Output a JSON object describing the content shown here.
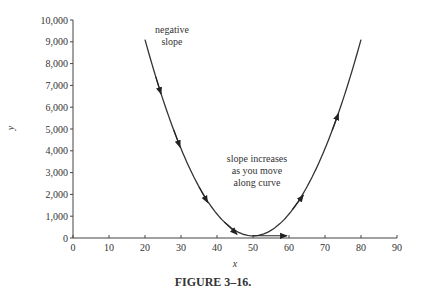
{
  "chart_data": {
    "type": "line",
    "title": "",
    "caption": "FIGURE 3–16.",
    "xlabel": "x",
    "ylabel": "y",
    "xlim": [
      0,
      90
    ],
    "ylim": [
      0,
      10000
    ],
    "x_ticks": [
      "0",
      "10",
      "20",
      "30",
      "40",
      "50",
      "60",
      "70",
      "80",
      "90"
    ],
    "y_ticks": [
      "0",
      "1,000",
      "2,000",
      "3,000",
      "4,000",
      "5,000",
      "6,000",
      "7,000",
      "8,000",
      "9,000",
      "10,000"
    ],
    "grid": false,
    "legend": null,
    "series": [
      {
        "name": "curve",
        "x": [
          20,
          25,
          30,
          35,
          40,
          45,
          50,
          55,
          60,
          65,
          70,
          75,
          80
        ],
        "y": [
          9100,
          6350,
          4100,
          2350,
          1100,
          350,
          100,
          350,
          1100,
          2350,
          4100,
          6350,
          9100
        ]
      }
    ],
    "tangent_arrows": [
      {
        "x": 23,
        "y": 7400,
        "direction": "down"
      },
      {
        "x": 28,
        "y": 4950,
        "direction": "down"
      },
      {
        "x": 35,
        "y": 2350,
        "direction": "down"
      },
      {
        "x": 42,
        "y": 750,
        "direction": "down"
      },
      {
        "x": 50,
        "y": 100,
        "direction": "flat-right"
      },
      {
        "x": 61,
        "y": 1350,
        "direction": "up"
      },
      {
        "x": 72,
        "y": 4950,
        "direction": "up"
      }
    ],
    "annotations": [
      {
        "text": [
          "negative",
          "slope"
        ],
        "x": 28,
        "y": 8700
      },
      {
        "text": [
          "slope increases",
          "as you move",
          "along curve"
        ],
        "x": 49,
        "y": 3300
      }
    ]
  },
  "labels": {
    "xlabel": "x",
    "ylabel": "y",
    "caption": "FIGURE 3–16.",
    "annot1_line1": "negative",
    "annot1_line2": "slope",
    "annot2_line1": "slope increases",
    "annot2_line2": "as you move",
    "annot2_line3": "along curve"
  }
}
